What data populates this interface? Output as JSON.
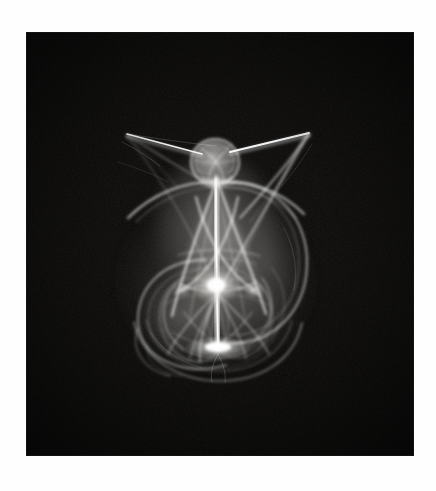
{
  "page": {
    "background_color": "#fefefe",
    "width": 436,
    "height": 491
  },
  "artwork": {
    "name": "fractal-flame-figure",
    "description": "Monochrome fractal flame attractor resembling a winged angelic figure or vase",
    "background_color": "#0a0908",
    "ink_color": "#ffffff",
    "panel": {
      "x": 26,
      "y": 32,
      "width": 388,
      "height": 424
    },
    "alt_text": "White luminous fractal flame on black field, shaped like a winged figure with a round head, long thin wing spikes, a tapering conical body and a bulbous base",
    "caption": ""
  },
  "chart_data": {
    "type": "scatter",
    "xlabel": "",
    "ylabel": "",
    "xlim": [
      0,
      388
    ],
    "ylim": [
      0,
      424
    ],
    "grid": false,
    "legend": null,
    "colormap": "grayscale",
    "features": [
      {
        "name": "head-ball",
        "cx": 189,
        "cy": 130,
        "rx": 23,
        "ry": 22,
        "brightness": 0.85
      },
      {
        "name": "left-wing-spike-tip",
        "x": 100,
        "y": 103,
        "brightness": 0.9
      },
      {
        "name": "right-wing-spike-tip",
        "x": 282,
        "y": 101,
        "brightness": 0.95
      },
      {
        "name": "body-apex",
        "x": 189,
        "y": 152,
        "brightness": 0.8
      },
      {
        "name": "central-bright-node",
        "x": 190,
        "y": 253,
        "brightness": 1.0
      },
      {
        "name": "base-convergence",
        "x": 192,
        "y": 313,
        "brightness": 1.0
      },
      {
        "name": "right-lobe-extent",
        "x": 276,
        "y": 240,
        "brightness": 0.55
      },
      {
        "name": "left-lobe-extent",
        "x": 108,
        "y": 278,
        "brightness": 0.55
      }
    ]
  }
}
